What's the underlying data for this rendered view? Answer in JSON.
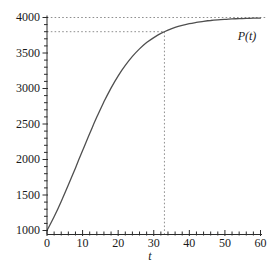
{
  "chart_data": {
    "type": "line",
    "title": "",
    "xlabel": "t",
    "ylabel": "",
    "curve_label": "P(t)",
    "xlim": [
      0,
      60
    ],
    "ylim": [
      1000,
      4000
    ],
    "x_major_ticks": [
      0,
      10,
      20,
      30,
      40,
      50,
      60
    ],
    "x_minor_step": 2,
    "y_major_ticks": [
      1000,
      1500,
      2000,
      2500,
      3000,
      3500,
      4000
    ],
    "y_minor_step": 100,
    "horizontal_asymptote": 4000,
    "marked_point": {
      "t": 33,
      "P": 3800
    },
    "dashed_guides": [
      {
        "type": "horizontal",
        "value": 4000,
        "from_t": 0,
        "to_t": 61.7
      },
      {
        "type": "horizontal",
        "value": 3800,
        "from_t": 0,
        "to_t": 33
      },
      {
        "type": "vertical",
        "value": 33,
        "from_P": 1000,
        "to_P": 3800
      }
    ],
    "series": [
      {
        "name": "P(t)",
        "points": [
          [
            0,
            1000
          ],
          [
            2,
            1195
          ],
          [
            4,
            1410
          ],
          [
            6,
            1640
          ],
          [
            8,
            1882
          ],
          [
            10,
            2126
          ],
          [
            12,
            2367
          ],
          [
            14,
            2597
          ],
          [
            16,
            2812
          ],
          [
            18,
            3006
          ],
          [
            20,
            3177
          ],
          [
            22,
            3326
          ],
          [
            24,
            3452
          ],
          [
            26,
            3558
          ],
          [
            28,
            3646
          ],
          [
            30,
            3717
          ],
          [
            32,
            3776
          ],
          [
            34,
            3822
          ],
          [
            36,
            3860
          ],
          [
            38,
            3889
          ],
          [
            40,
            3913
          ],
          [
            42,
            3931
          ],
          [
            44,
            3946
          ],
          [
            46,
            3958
          ],
          [
            48,
            3967
          ],
          [
            50,
            3974
          ],
          [
            52,
            3980
          ],
          [
            54,
            3984
          ],
          [
            56,
            3987
          ],
          [
            58,
            3990
          ],
          [
            60,
            3992
          ]
        ]
      }
    ],
    "grid": "off",
    "legend_position": "none",
    "colors": {
      "curve": "#4f4f4f",
      "axis": "#2b2b2b",
      "dashed": "#8f8f8f",
      "text": "#1a1a1a",
      "background": "#ffffff"
    }
  }
}
